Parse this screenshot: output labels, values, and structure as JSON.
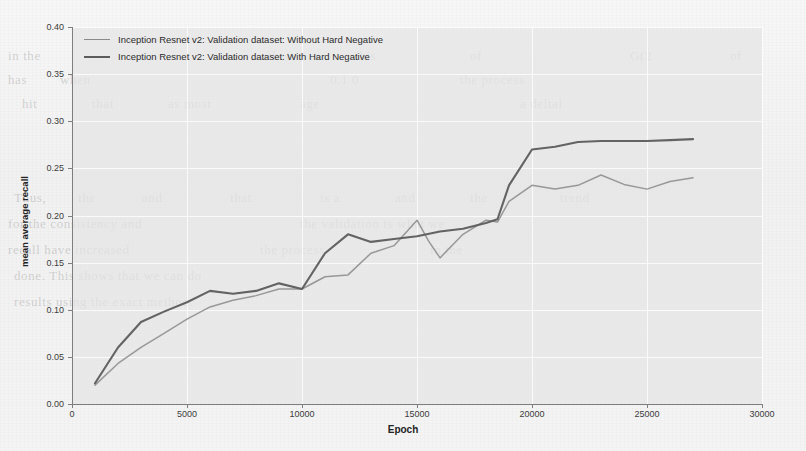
{
  "figure": {
    "background_color": "#f2f2f2",
    "plot_background_color": "#e4e4e4"
  },
  "legend": {
    "position": "upper-left",
    "entries": [
      {
        "label": "Inception Resnet v2: Validation dataset: Without Hard Negative",
        "color": "#8a8a8a",
        "width": 1.6
      },
      {
        "label": "Inception Resnet v2: Validation dataset: With Hard Negative",
        "color": "#5c5c5c",
        "width": 2.2
      }
    ]
  },
  "axes": {
    "x_title": "Epoch",
    "y_title": "mean average recall",
    "x_ticks": [
      "0",
      "5000",
      "10000",
      "15000",
      "20000",
      "25000",
      "30000"
    ],
    "y_ticks": [
      "0.00",
      "0.05",
      "0.10",
      "0.15",
      "0.20",
      "0.25",
      "0.30",
      "0.35",
      "0.40"
    ]
  },
  "background_text": [
    {
      "text": "in the",
      "x": 8,
      "y": 48,
      "size": 13
    },
    {
      "text": "that",
      "x": 268,
      "y": 48,
      "size": 13
    },
    {
      "text": "this",
      "x": 355,
      "y": 48,
      "size": 13
    },
    {
      "text": "of",
      "x": 470,
      "y": 48,
      "size": 13
    },
    {
      "text": "G(2",
      "x": 630,
      "y": 48,
      "size": 13
    },
    {
      "text": "of",
      "x": 730,
      "y": 48,
      "size": 13
    },
    {
      "text": "has",
      "x": 8,
      "y": 72,
      "size": 13
    },
    {
      "text": "when",
      "x": 60,
      "y": 72,
      "size": 13
    },
    {
      "text": "0.1 0",
      "x": 330,
      "y": 72,
      "size": 13
    },
    {
      "text": "the process",
      "x": 460,
      "y": 72,
      "size": 13
    },
    {
      "text": "hit",
      "x": 22,
      "y": 96,
      "size": 13
    },
    {
      "text": "that",
      "x": 92,
      "y": 96,
      "size": 13
    },
    {
      "text": "as most",
      "x": 168,
      "y": 96,
      "size": 13
    },
    {
      "text": "age",
      "x": 300,
      "y": 96,
      "size": 13
    },
    {
      "text": "a deltal",
      "x": 520,
      "y": 96,
      "size": 13
    },
    {
      "text": "Thus,",
      "x": 14,
      "y": 190,
      "size": 13
    },
    {
      "text": "the",
      "x": 78,
      "y": 190,
      "size": 13
    },
    {
      "text": "and",
      "x": 142,
      "y": 190,
      "size": 13
    },
    {
      "text": "that",
      "x": 230,
      "y": 190,
      "size": 13
    },
    {
      "text": "is a",
      "x": 320,
      "y": 190,
      "size": 13
    },
    {
      "text": "and",
      "x": 395,
      "y": 190,
      "size": 13
    },
    {
      "text": "the",
      "x": 470,
      "y": 190,
      "size": 13
    },
    {
      "text": "trend",
      "x": 560,
      "y": 190,
      "size": 13
    },
    {
      "text": "for the consistency and",
      "x": 8,
      "y": 216,
      "size": 13
    },
    {
      "text": "the validation is what we",
      "x": 300,
      "y": 216,
      "size": 13
    },
    {
      "text": "recall have increased",
      "x": 8,
      "y": 242,
      "size": 13
    },
    {
      "text": "the process",
      "x": 260,
      "y": 242,
      "size": 13
    },
    {
      "text": "in the",
      "x": 430,
      "y": 242,
      "size": 13
    },
    {
      "text": "done. This shows that we can do",
      "x": 14,
      "y": 268,
      "size": 13
    },
    {
      "text": "results using the exact method.",
      "x": 14,
      "y": 294,
      "size": 13
    }
  ],
  "chart_data": {
    "type": "line",
    "title": "",
    "xlabel": "Epoch",
    "ylabel": "mean average recall",
    "xlim": [
      0,
      30000
    ],
    "ylim": [
      0.0,
      0.4
    ],
    "grid": true,
    "legend_position": "upper-left",
    "series": [
      {
        "name": "Inception Resnet v2: Validation dataset: Without Hard Negative",
        "color": "#8a8a8a",
        "x": [
          1000,
          2000,
          3000,
          4000,
          5000,
          6000,
          7000,
          8000,
          9000,
          10000,
          11000,
          12000,
          13000,
          14000,
          15000,
          15500,
          16000,
          17000,
          18000,
          18500,
          19000,
          20000,
          21000,
          22000,
          23000,
          24000,
          25000,
          26000,
          27000
        ],
        "y": [
          0.02,
          0.043,
          0.06,
          0.075,
          0.09,
          0.103,
          0.11,
          0.115,
          0.122,
          0.122,
          0.135,
          0.137,
          0.16,
          0.168,
          0.195,
          0.173,
          0.155,
          0.18,
          0.195,
          0.193,
          0.215,
          0.232,
          0.228,
          0.232,
          0.243,
          0.233,
          0.228,
          0.236,
          0.24
        ]
      },
      {
        "name": "Inception Resnet v2: Validation dataset: With Hard Negative",
        "color": "#5c5c5c",
        "x": [
          1000,
          2000,
          3000,
          4000,
          5000,
          6000,
          7000,
          8000,
          9000,
          10000,
          11000,
          12000,
          13000,
          14000,
          15000,
          16000,
          17000,
          18000,
          18500,
          19000,
          20000,
          21000,
          22000,
          23000,
          24000,
          25000,
          26000,
          27000
        ],
        "y": [
          0.022,
          0.06,
          0.087,
          0.098,
          0.108,
          0.12,
          0.117,
          0.12,
          0.128,
          0.122,
          0.16,
          0.18,
          0.172,
          0.175,
          0.178,
          0.183,
          0.186,
          0.192,
          0.196,
          0.232,
          0.27,
          0.273,
          0.278,
          0.279,
          0.279,
          0.279,
          0.28,
          0.281
        ]
      }
    ]
  }
}
